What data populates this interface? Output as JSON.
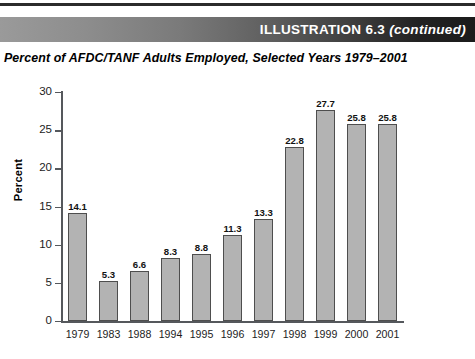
{
  "banner": {
    "title": "ILLUSTRATION 6.3",
    "continued": "(continued)"
  },
  "subtitle": "Percent of AFDC/TANF Adults Employed, Selected Years 1979–2001",
  "colors": {
    "banner_dark": "#1b1b1b",
    "banner_light": "#9a9a9a",
    "bar_fill": "#b3b3b3",
    "bar_border": "#4e4e4e",
    "axis": "#55585c",
    "text": "#000000"
  },
  "chart_data": {
    "type": "bar",
    "title": "Percent of AFDC/TANF Adults Employed, Selected Years 1979–2001",
    "xlabel": "",
    "ylabel": "Percent",
    "categories": [
      "1979",
      "1983",
      "1988",
      "1994",
      "1995",
      "1996",
      "1997",
      "1998",
      "1999",
      "2000",
      "2001"
    ],
    "values": [
      14.1,
      5.3,
      6.6,
      8.3,
      8.8,
      11.3,
      13.3,
      22.8,
      27.7,
      25.8,
      25.8
    ],
    "value_labels": [
      "14.1",
      "5.3",
      "6.6",
      "8.3",
      "8.8",
      "11.3",
      "13.3",
      "22.8",
      "27.7",
      "25.8",
      "25.8"
    ],
    "ylim": [
      0,
      30
    ],
    "yticks": [
      0,
      5,
      10,
      15,
      20,
      25,
      30
    ],
    "ytick_labels": [
      "0",
      "5",
      "10",
      "15",
      "20",
      "25",
      "30"
    ],
    "grid": false,
    "legend": null
  }
}
